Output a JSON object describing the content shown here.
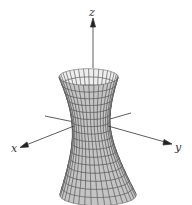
{
  "figure": {
    "surface": {
      "type": "hyperboloid-one-sheet",
      "equation": "x^2/a^2 + y^2/b^2 - z^2/c^2 = 1",
      "fill_front": "#c4c4c4",
      "fill_back": "#eeeeee",
      "mesh_color": "#444444",
      "rings": 16,
      "meridians": 36
    },
    "axes": {
      "color": "#333333",
      "labels": {
        "x": "x",
        "y": "y",
        "z": "z"
      }
    }
  }
}
